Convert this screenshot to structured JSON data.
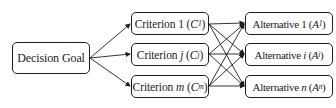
{
  "diagram": {
    "goal": {
      "label": "Decision Goal"
    },
    "criteria": [
      {
        "prefix": "Criterion",
        "index": "1",
        "symbol": "C",
        "sub": "1"
      },
      {
        "prefix": "Criterion",
        "index": "j",
        "symbol": "C",
        "sub": "j"
      },
      {
        "prefix": "Criterion",
        "index": "m",
        "symbol": "C",
        "sub": "m"
      }
    ],
    "alternatives": [
      {
        "prefix": "Alternative",
        "index": "1",
        "symbol": "A",
        "sub": "1"
      },
      {
        "prefix": "Alternative",
        "index": "i",
        "symbol": "A",
        "sub": "i"
      },
      {
        "prefix": "Alternative",
        "index": "n",
        "symbol": "A",
        "sub": "n"
      }
    ],
    "edges": {
      "goal_to_criteria": "arrows",
      "criteria_to_alternatives": "fully-connected (3x3) arrows"
    },
    "colors": {
      "stroke": "#1e1e1e",
      "fill": "#ffffff",
      "text": "#222222"
    }
  }
}
